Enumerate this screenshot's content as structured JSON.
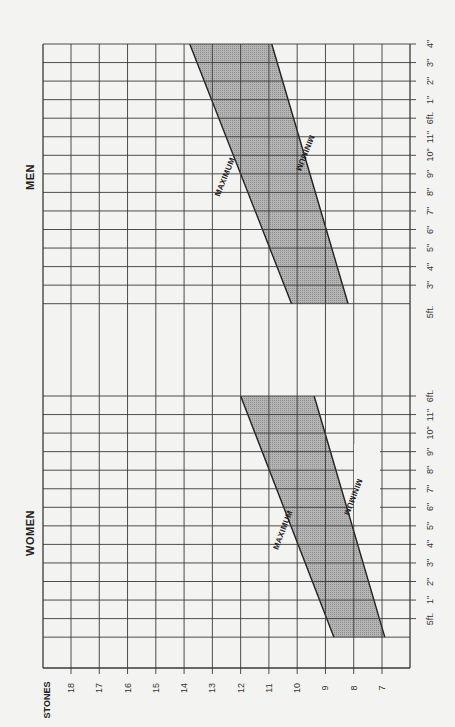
{
  "chart_data": {
    "type": "area",
    "orientation": "rotated -90deg (read with page turned)",
    "xlabel": "STONES",
    "ylabel": "Height",
    "stone_ticks": [
      "18",
      "17",
      "16",
      "15",
      "14",
      "13",
      "12",
      "11",
      "10",
      "9",
      "8",
      "7"
    ],
    "grid": true,
    "sections": [
      {
        "name": "MEN",
        "height_ticks": [
          "3\"",
          "4\"",
          "5\"",
          "6\"",
          "7\"",
          "8\"",
          "9\"",
          "10\"",
          "11\"",
          "6ft.",
          "1\"",
          "2\"",
          "3\"",
          "4\""
        ],
        "base_label": "5ft.",
        "series": [
          {
            "name": "MAXIMUM",
            "height_in": [
              62,
              76
            ],
            "stones": [
              10.2,
              13.8
            ]
          },
          {
            "name": "MINIMUM",
            "height_in": [
              62,
              76
            ],
            "stones": [
              8.2,
              10.9
            ]
          }
        ]
      },
      {
        "name": "WOMEN",
        "height_ticks": [
          "5ft.",
          "1\"",
          "2\"",
          "3\"",
          "4\"",
          "5\"",
          "6\"",
          "7\"",
          "8\"",
          "9\"",
          "10\"",
          "11\"",
          "6ft."
        ],
        "series": [
          {
            "name": "MAXIMUM",
            "height_in": [
              59,
              72
            ],
            "stones": [
              8.7,
              12.0
            ]
          },
          {
            "name": "MINIMUM",
            "height_in": [
              59,
              72
            ],
            "stones": [
              6.9,
              9.4
            ]
          }
        ]
      }
    ]
  },
  "labels": {
    "men": "MEN",
    "women": "WOMEN",
    "maximum": "MAXIMUM",
    "minimum": "MINIMUM",
    "stones": "STONES",
    "men_base": "5ft."
  },
  "colors": {
    "grid": "#3a3a3a",
    "band": "#a9a9a9",
    "background": "#f3f3f1",
    "ink": "#222222"
  }
}
